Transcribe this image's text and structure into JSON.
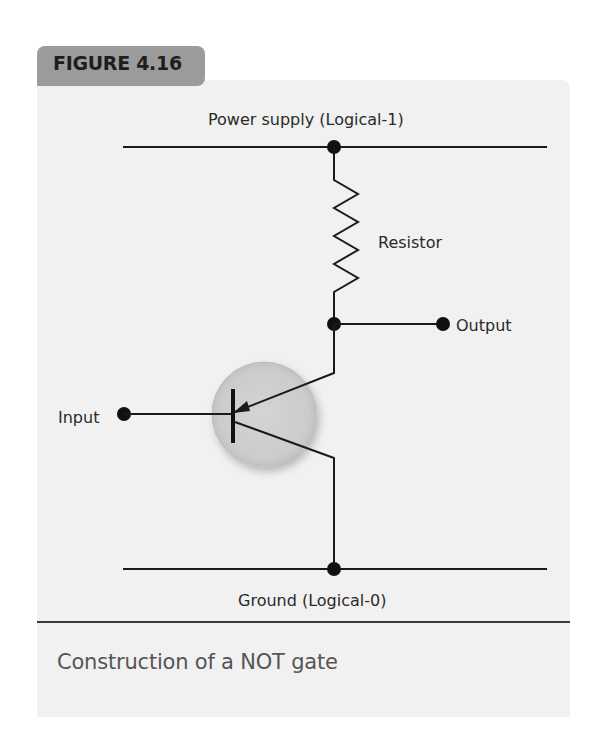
{
  "figure": {
    "label": "FIGURE 4.16",
    "caption": "Construction of a NOT gate"
  },
  "diagram": {
    "labels": {
      "power_supply": "Power supply (Logical-1)",
      "resistor": "Resistor",
      "output": "Output",
      "input": "Input",
      "ground": "Ground (Logical-0)"
    },
    "colors": {
      "card_background": "#f1f1f1",
      "tab_background": "#9b9b9b",
      "wire": "#1a1a1a",
      "transistor_circle": "#d0d0d0",
      "caption_text": "#555555"
    },
    "components": [
      "power rail",
      "resistor",
      "output node",
      "transistor (PNP symbol)",
      "input node",
      "ground rail"
    ]
  }
}
